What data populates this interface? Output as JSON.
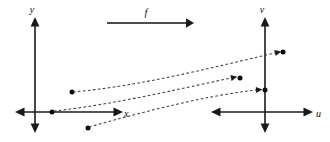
{
  "figure": {
    "background_color": "#ffffff",
    "ink_color": "#1a1a1a",
    "dash_color": "#3a3a3a",
    "width": 330,
    "height": 142
  },
  "mapping_arrow": {
    "label": "f",
    "label_x": 146,
    "label_y": 16,
    "start_x": 107,
    "end_x": 192,
    "y": 23
  },
  "domain_plane": {
    "name": "xy-plane",
    "vertical_axis_label": "y",
    "horizontal_axis_label": "x",
    "vertical_label_x": 32,
    "vertical_label_y": 12,
    "horizontal_label_x": 124,
    "horizontal_label_y": 117,
    "origin_x": 35,
    "origin_y": 112,
    "axis_top_y": 18,
    "axis_bottom_y": 132,
    "axis_left_x": 16,
    "axis_right_x": 122,
    "points": [
      {
        "name": "domain-point-a",
        "x": 72,
        "y": 92
      },
      {
        "name": "domain-point-b",
        "x": 52,
        "y": 112
      },
      {
        "name": "domain-point-c",
        "x": 88,
        "y": 128
      }
    ]
  },
  "codomain_plane": {
    "name": "uv-plane",
    "vertical_axis_label": "v",
    "horizontal_axis_label": "u",
    "vertical_label_x": 262,
    "vertical_label_y": 12,
    "horizontal_label_x": 317,
    "horizontal_label_y": 117,
    "origin_x": 265,
    "origin_y": 112,
    "axis_top_y": 18,
    "axis_bottom_y": 132,
    "axis_left_x": 212,
    "axis_right_x": 312,
    "points": [
      {
        "name": "image-point-a",
        "x": 283,
        "y": 52
      },
      {
        "name": "image-point-b",
        "x": 240,
        "y": 78
      },
      {
        "name": "image-point-c",
        "x": 265,
        "y": 90
      }
    ]
  },
  "dashed_mappings": [
    {
      "name": "mapping-curve-a",
      "from_point": "domain-point-a",
      "to_point": "image-point-a",
      "path": "M 73 92 C 140 86, 210 68, 275 53"
    },
    {
      "name": "mapping-curve-b",
      "from_point": "domain-point-b",
      "to_point": "image-point-b",
      "path": "M 54 111 C 110 105, 175 90, 231 78"
    },
    {
      "name": "mapping-curve-c",
      "from_point": "domain-point-c",
      "to_point": "image-point-c",
      "path": "M 89 127 C 150 110, 205 96, 256 90"
    }
  ],
  "dash_arrow_heads": [
    {
      "name": "dash-arrowhead-a",
      "x": 275,
      "y": 53,
      "angle": -14
    },
    {
      "name": "dash-arrowhead-b",
      "x": 231,
      "y": 78,
      "angle": -11
    },
    {
      "name": "dash-arrowhead-c",
      "x": 256,
      "y": 90,
      "angle": -4
    }
  ]
}
